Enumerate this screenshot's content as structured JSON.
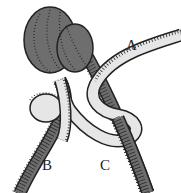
{
  "diagram": {
    "type": "knot-illustration",
    "labels": {
      "a": "A",
      "b": "B",
      "c": "C"
    },
    "colors": {
      "dark_rope": "#6e6e6e",
      "light_rope": "#e6e6e6",
      "hatch": "#222222",
      "background": "#ffffff"
    }
  }
}
